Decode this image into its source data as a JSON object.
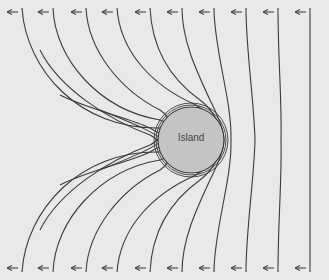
{
  "diagram": {
    "island": {
      "label": "Island",
      "cx": 191,
      "cy": 140,
      "r": 33,
      "fill": "#c4c4c4"
    },
    "wave_direction": "left",
    "arrow_icon": "left-arrow-icon",
    "crest_x_positions": [
      22,
      53,
      86,
      117,
      150,
      182,
      214,
      246,
      278,
      310
    ],
    "background": "#e9e9e9",
    "line_color": "#3a3a3a"
  }
}
